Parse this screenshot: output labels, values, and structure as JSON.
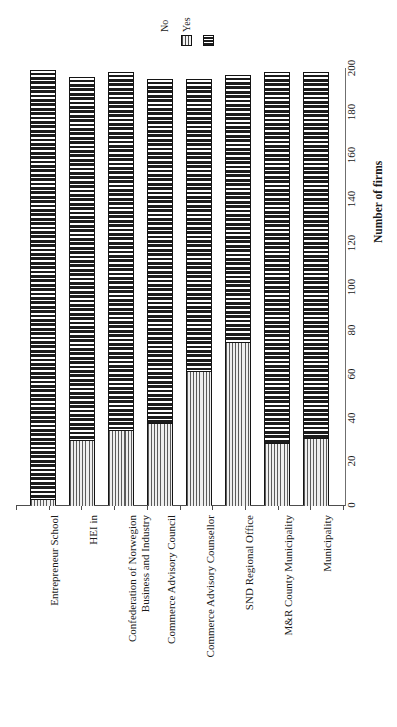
{
  "chart_data": {
    "type": "bar",
    "orientation": "horizontal-rotated",
    "stacked": true,
    "title": "",
    "subtitle": "",
    "xlabel": "",
    "ylabel": "Number of firms",
    "ylim": [
      0,
      200
    ],
    "grid": false,
    "legend_position": "top",
    "tick_labels": [
      "0",
      "20",
      "40",
      "60",
      "80",
      "100",
      "120",
      "140",
      "160",
      "180",
      "200"
    ],
    "tick_values": [
      0,
      20,
      40,
      60,
      80,
      100,
      120,
      140,
      160,
      180,
      200
    ],
    "categories": [
      "Entrepreneur School",
      "HEI in",
      "Confederation of Norwegion\nBusiness and Industry",
      "Commerce Advisory Council",
      "Commerce Advisory Counsellor",
      "SND Regional Office",
      "M&R County Municipality",
      "Municipality"
    ],
    "series": [
      {
        "name": "No",
        "color": "#f2f2f2",
        "pattern": "vertical-dotted-lines",
        "values": [
          3,
          30,
          35,
          38,
          62,
          75,
          29,
          31
        ]
      },
      {
        "name": "Yes",
        "color": "#1b1b1b",
        "pattern": "horizontal-dense-hatch",
        "values": [
          196,
          166,
          163,
          157,
          133,
          122,
          169,
          167
        ]
      }
    ],
    "totals": [
      199,
      196,
      198,
      195,
      195,
      197,
      198,
      198
    ]
  },
  "legend": {
    "entries": [
      {
        "label": "No",
        "swatch": "no-swatch"
      },
      {
        "label": "Yes",
        "swatch": "yes-swatch"
      }
    ]
  },
  "axis": {
    "value_axis_title": "Number of firms"
  }
}
